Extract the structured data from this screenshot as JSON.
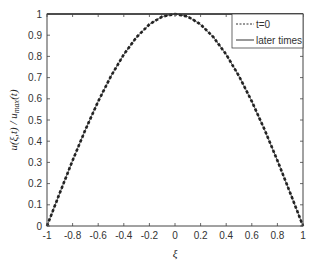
{
  "chart_data": {
    "type": "line",
    "title": "",
    "xlabel": "ξ",
    "ylabel": "u(ξ,t) / u_max(t)",
    "xlim": [
      -1,
      1
    ],
    "ylim": [
      0,
      1
    ],
    "grid": false,
    "legend_position": "upper right",
    "xticks": [
      "-1",
      "-0.8",
      "-0.6",
      "-0.4",
      "-0.2",
      "0",
      "0.2",
      "0.4",
      "0.6",
      "0.8",
      "1"
    ],
    "yticks": [
      "0",
      "0.1",
      "0.2",
      "0.3",
      "0.4",
      "0.5",
      "0.6",
      "0.7",
      "0.8",
      "0.9",
      "1"
    ],
    "x": [
      -1,
      -0.9,
      -0.8,
      -0.7,
      -0.6,
      -0.5,
      -0.4,
      -0.3,
      -0.2,
      -0.1,
      0,
      0.1,
      0.2,
      0.3,
      0.4,
      0.5,
      0.6,
      0.7,
      0.8,
      0.9,
      1
    ],
    "series": [
      {
        "name": "t=0",
        "style": "dashed",
        "color": "#000000",
        "values": [
          0,
          0.156,
          0.309,
          0.454,
          0.588,
          0.707,
          0.809,
          0.891,
          0.951,
          0.988,
          1,
          0.988,
          0.951,
          0.891,
          0.809,
          0.707,
          0.588,
          0.454,
          0.309,
          0.156,
          0
        ]
      },
      {
        "name": "later times",
        "style": "solid",
        "color": "#000000",
        "values": [
          0,
          0.156,
          0.309,
          0.454,
          0.588,
          0.707,
          0.809,
          0.891,
          0.951,
          0.988,
          1,
          0.988,
          0.951,
          0.891,
          0.809,
          0.707,
          0.588,
          0.454,
          0.309,
          0.156,
          0
        ]
      }
    ]
  },
  "legend": {
    "entries": [
      {
        "label": "t=0",
        "style": "dashed"
      },
      {
        "label": "later times",
        "style": "solid"
      }
    ]
  },
  "axes": {
    "xlabel": "ξ",
    "ylabel_main": "u(ξ,t) / u",
    "ylabel_sub": "max",
    "ylabel_tail": "(t)"
  }
}
